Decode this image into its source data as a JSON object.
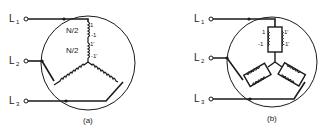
{
  "figure": {
    "panels": [
      {
        "id": "a",
        "caption": "(a)",
        "lines": [
          "L1",
          "L2",
          "L3"
        ],
        "line_labels": {
          "L1": {
            "main": "L",
            "sub": "1"
          },
          "L2": {
            "main": "L",
            "sub": "2"
          },
          "L3": {
            "main": "L",
            "sub": "3"
          }
        },
        "winding_labels": {
          "upper_half": "N/2",
          "lower_half": "N/2"
        },
        "terminal_labels": {
          "t1": "1",
          "t1n": "-1",
          "t1p": "1'",
          "t1pn": "-1'"
        },
        "description": "Series connection of two half-windings (N/2) in one phase of a wye-connected stator"
      },
      {
        "id": "b",
        "caption": "(b)",
        "lines": [
          "L1",
          "L2",
          "L3"
        ],
        "line_labels": {
          "L1": {
            "main": "L",
            "sub": "1"
          },
          "L2": {
            "main": "L",
            "sub": "2"
          },
          "L3": {
            "main": "L",
            "sub": "3"
          }
        },
        "terminal_labels": {
          "t1": "1",
          "t1n": "-1",
          "t1p": "1'",
          "t1pn": "-1'"
        },
        "description": "Parallel connection of two half-windings in each phase of a wye-connected stator"
      }
    ],
    "colors": {
      "ink": "#1a1a1a",
      "background": "#ffffff"
    }
  }
}
